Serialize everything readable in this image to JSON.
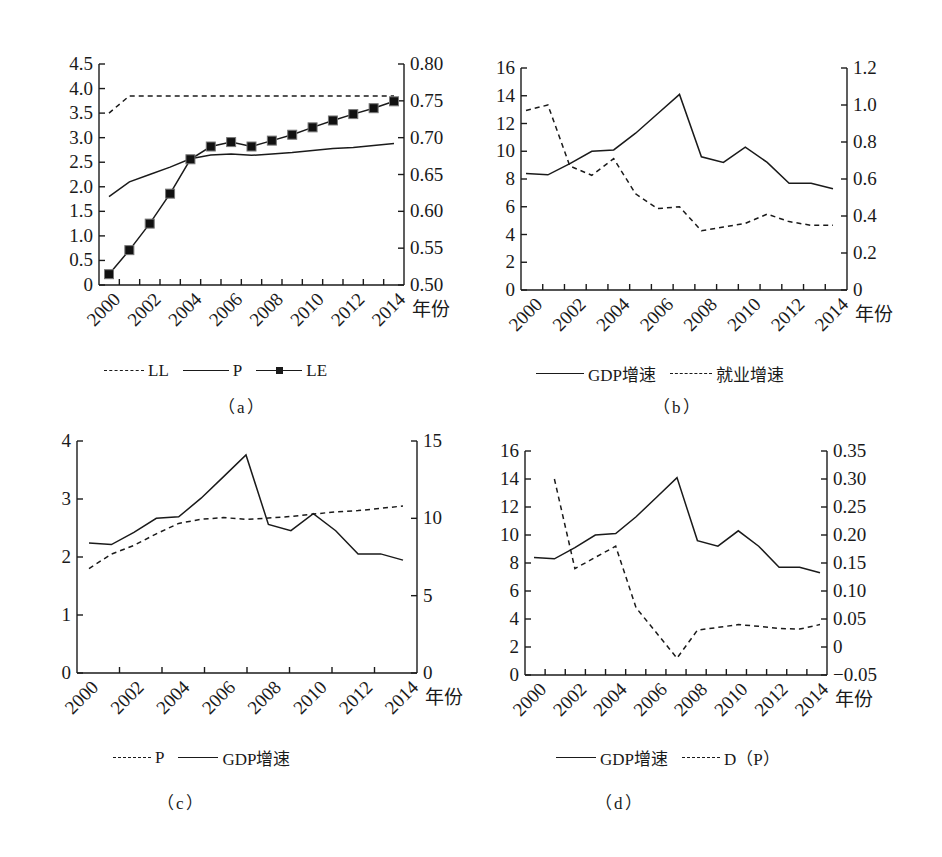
{
  "figure": {
    "panels": [
      {
        "id": "a",
        "caption": "（a）",
        "legend": [
          {
            "label": "LL",
            "style": "dash"
          },
          {
            "label": "P",
            "style": "line"
          },
          {
            "label": "LE",
            "style": "marker"
          }
        ]
      },
      {
        "id": "b",
        "caption": "（b）",
        "legend": [
          {
            "label": "GDP增速",
            "style": "line"
          },
          {
            "label": "就业增速",
            "style": "dash"
          }
        ]
      },
      {
        "id": "c",
        "caption": "（c）",
        "legend": [
          {
            "label": "P",
            "style": "dash"
          },
          {
            "label": "GDP增速",
            "style": "line"
          }
        ]
      },
      {
        "id": "d",
        "caption": "（d）",
        "legend": [
          {
            "label": "GDP增速",
            "style": "line"
          },
          {
            "label": "D（P）",
            "style": "dash"
          }
        ]
      }
    ]
  },
  "chart_data": [
    {
      "panel": "a",
      "type": "line",
      "title": "",
      "xlabel": "年份",
      "x": [
        2000,
        2001,
        2002,
        2003,
        2004,
        2005,
        2006,
        2007,
        2008,
        2009,
        2010,
        2011,
        2012,
        2013,
        2014
      ],
      "x_tick_labels": [
        "2000",
        "2002",
        "2004",
        "2006",
        "2008",
        "2010",
        "2012",
        "2014"
      ],
      "ylim_left": [
        0,
        4.5
      ],
      "y_left_ticks": [
        "0",
        "0.5",
        "1.0",
        "1.5",
        "2.0",
        "2.5",
        "3.0",
        "3.5",
        "4.0",
        "4.5"
      ],
      "ylim_right": [
        0.5,
        0.8
      ],
      "y_right_ticks": [
        "0.50",
        "0.55",
        "0.60",
        "0.65",
        "0.70",
        "0.75",
        "0.80"
      ],
      "grid": false,
      "legend_position": "bottom",
      "series": [
        {
          "name": "LL",
          "axis": "left",
          "style": "dash",
          "values": [
            3.5,
            3.85,
            3.85,
            3.85,
            3.85,
            3.85,
            3.85,
            3.85,
            3.85,
            3.85,
            3.85,
            3.85,
            3.85,
            3.85,
            3.85
          ]
        },
        {
          "name": "P",
          "axis": "left",
          "style": "line",
          "values": [
            1.8,
            2.1,
            2.25,
            2.4,
            2.57,
            2.65,
            2.67,
            2.64,
            2.67,
            2.7,
            2.74,
            2.78,
            2.8,
            2.84,
            2.88
          ]
        },
        {
          "name": "LE",
          "axis": "left",
          "style": "marker",
          "values": [
            0.22,
            0.71,
            1.25,
            1.86,
            2.56,
            2.82,
            2.91,
            2.82,
            2.94,
            3.06,
            3.21,
            3.35,
            3.48,
            3.6,
            3.74
          ]
        }
      ]
    },
    {
      "panel": "b",
      "type": "line",
      "title": "",
      "xlabel": "年份",
      "x": [
        2000,
        2001,
        2002,
        2003,
        2004,
        2005,
        2006,
        2007,
        2008,
        2009,
        2010,
        2011,
        2012,
        2013,
        2014
      ],
      "x_tick_labels": [
        "2000",
        "2002",
        "2004",
        "2006",
        "2008",
        "2010",
        "2012",
        "2014"
      ],
      "ylim_left": [
        0,
        16
      ],
      "y_left_ticks": [
        "0",
        "2",
        "4",
        "6",
        "8",
        "10",
        "12",
        "14",
        "16"
      ],
      "ylim_right": [
        0,
        1.2
      ],
      "y_right_ticks": [
        "0",
        "0.2",
        "0.4",
        "0.6",
        "0.8",
        "1.0",
        "1.2"
      ],
      "grid": false,
      "legend_position": "bottom",
      "series": [
        {
          "name": "GDP增速",
          "axis": "left",
          "style": "line",
          "values": [
            8.4,
            8.3,
            9.1,
            10.0,
            10.1,
            11.3,
            12.7,
            14.1,
            9.6,
            9.2,
            10.3,
            9.2,
            7.7,
            7.7,
            7.3
          ]
        },
        {
          "name": "就业增速",
          "axis": "right",
          "style": "dash",
          "values": [
            0.97,
            1.0,
            0.67,
            0.62,
            0.71,
            0.52,
            0.44,
            0.45,
            0.32,
            0.34,
            0.36,
            0.41,
            0.37,
            0.35,
            0.35
          ]
        }
      ]
    },
    {
      "panel": "c",
      "type": "line",
      "title": "",
      "xlabel": "年份",
      "x": [
        2000,
        2001,
        2002,
        2003,
        2004,
        2005,
        2006,
        2007,
        2008,
        2009,
        2010,
        2011,
        2012,
        2013,
        2014
      ],
      "x_tick_labels": [
        "2000",
        "2002",
        "2004",
        "2006",
        "2008",
        "2010",
        "2012",
        "2014"
      ],
      "ylim_left": [
        0,
        4
      ],
      "y_left_ticks": [
        "0",
        "1",
        "2",
        "3",
        "4"
      ],
      "ylim_right": [
        0,
        15
      ],
      "y_right_ticks": [
        "0",
        "5",
        "10",
        "15"
      ],
      "grid": false,
      "legend_position": "bottom",
      "series": [
        {
          "name": "P",
          "axis": "left",
          "style": "dash",
          "values": [
            1.8,
            2.05,
            2.2,
            2.4,
            2.58,
            2.65,
            2.68,
            2.65,
            2.67,
            2.7,
            2.74,
            2.78,
            2.8,
            2.84,
            2.88
          ]
        },
        {
          "name": "GDP增速",
          "axis": "right",
          "style": "line",
          "values": [
            8.4,
            8.3,
            9.1,
            10.0,
            10.1,
            11.3,
            12.7,
            14.1,
            9.6,
            9.2,
            10.3,
            9.2,
            7.7,
            7.7,
            7.3
          ]
        }
      ]
    },
    {
      "panel": "d",
      "type": "line",
      "title": "",
      "xlabel": "年份",
      "x": [
        2000,
        2001,
        2002,
        2003,
        2004,
        2005,
        2006,
        2007,
        2008,
        2009,
        2010,
        2011,
        2012,
        2013,
        2014
      ],
      "x_tick_labels": [
        "2000",
        "2002",
        "2004",
        "2006",
        "2008",
        "2010",
        "2012",
        "2014"
      ],
      "ylim_left": [
        0,
        16
      ],
      "y_left_ticks": [
        "0",
        "2",
        "4",
        "6",
        "8",
        "10",
        "12",
        "14",
        "16"
      ],
      "ylim_right": [
        -0.05,
        0.35
      ],
      "y_right_ticks": [
        "−0.05",
        "0",
        "0.05",
        "0.10",
        "0.15",
        "0.20",
        "0.25",
        "0.30",
        "0.35"
      ],
      "grid": false,
      "legend_position": "bottom",
      "series": [
        {
          "name": "GDP增速",
          "axis": "left",
          "style": "line",
          "values": [
            8.4,
            8.3,
            9.1,
            10.0,
            10.1,
            11.3,
            12.7,
            14.1,
            9.6,
            9.2,
            10.3,
            9.2,
            7.7,
            7.7,
            7.3
          ]
        },
        {
          "name": "D（P）",
          "axis": "right",
          "style": "dash",
          "values": [
            null,
            0.3,
            0.14,
            0.16,
            0.18,
            0.07,
            0.025,
            -0.02,
            0.03,
            0.035,
            0.04,
            0.037,
            0.033,
            0.032,
            0.04
          ]
        }
      ]
    }
  ]
}
